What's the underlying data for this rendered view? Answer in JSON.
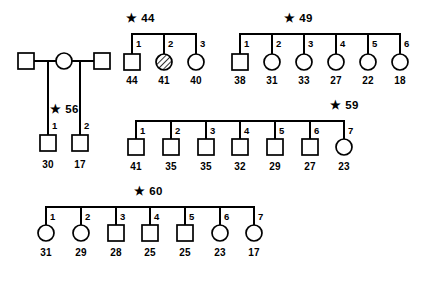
{
  "figure": {
    "background_color": "#ffffff",
    "line_color": "#000000",
    "width": 422,
    "height": 304
  },
  "legend_symbols": {
    "square": "male",
    "circle": "female",
    "hatched_circle": "affected-female"
  },
  "founders": {
    "father_left": {
      "symbol": "square",
      "sex": "male"
    },
    "mother": {
      "symbol": "circle",
      "sex": "female"
    },
    "father_right": {
      "symbol": "square",
      "sex": "male"
    }
  },
  "families": [
    {
      "id": "family-56",
      "label": "★ 56",
      "label_text": "56",
      "children": [
        {
          "index": "1",
          "symbol": "square",
          "sex": "male",
          "age": "30",
          "affected": false
        },
        {
          "index": "2",
          "symbol": "square",
          "sex": "male",
          "age": "17",
          "affected": false
        }
      ]
    },
    {
      "id": "family-44",
      "label": "★ 44",
      "label_text": "44",
      "children": [
        {
          "index": "1",
          "symbol": "square",
          "sex": "male",
          "age": "44",
          "affected": false
        },
        {
          "index": "2",
          "symbol": "circle",
          "sex": "female",
          "age": "41",
          "affected": true
        },
        {
          "index": "3",
          "symbol": "circle",
          "sex": "female",
          "age": "40",
          "affected": false
        }
      ]
    },
    {
      "id": "family-49",
      "label": "★ 49",
      "label_text": "49",
      "children": [
        {
          "index": "1",
          "symbol": "square",
          "sex": "male",
          "age": "38",
          "affected": false
        },
        {
          "index": "2",
          "symbol": "circle",
          "sex": "female",
          "age": "31",
          "affected": false
        },
        {
          "index": "3",
          "symbol": "circle",
          "sex": "female",
          "age": "33",
          "affected": false
        },
        {
          "index": "4",
          "symbol": "circle",
          "sex": "female",
          "age": "27",
          "affected": false
        },
        {
          "index": "5",
          "symbol": "circle",
          "sex": "female",
          "age": "22",
          "affected": false
        },
        {
          "index": "6",
          "symbol": "circle",
          "sex": "female",
          "age": "18",
          "affected": false
        }
      ]
    },
    {
      "id": "family-59",
      "label": "★ 59",
      "label_text": "59",
      "children": [
        {
          "index": "1",
          "symbol": "square",
          "sex": "male",
          "age": "41",
          "affected": false
        },
        {
          "index": "2",
          "symbol": "square",
          "sex": "male",
          "age": "35",
          "affected": false
        },
        {
          "index": "3",
          "symbol": "square",
          "sex": "male",
          "age": "35",
          "affected": false
        },
        {
          "index": "4",
          "symbol": "square",
          "sex": "male",
          "age": "32",
          "affected": false
        },
        {
          "index": "5",
          "symbol": "square",
          "sex": "male",
          "age": "29",
          "affected": false
        },
        {
          "index": "6",
          "symbol": "square",
          "sex": "male",
          "age": "27",
          "affected": false
        },
        {
          "index": "7",
          "symbol": "circle",
          "sex": "female",
          "age": "23",
          "affected": false
        }
      ]
    },
    {
      "id": "family-60",
      "label": "★ 60",
      "label_text": "60",
      "children": [
        {
          "index": "1",
          "symbol": "circle",
          "sex": "female",
          "age": "31",
          "affected": false
        },
        {
          "index": "2",
          "symbol": "circle",
          "sex": "female",
          "age": "29",
          "affected": false
        },
        {
          "index": "3",
          "symbol": "square",
          "sex": "male",
          "age": "28",
          "affected": false
        },
        {
          "index": "4",
          "symbol": "square",
          "sex": "male",
          "age": "25",
          "affected": false
        },
        {
          "index": "5",
          "symbol": "square",
          "sex": "male",
          "age": "25",
          "affected": false
        },
        {
          "index": "6",
          "symbol": "circle",
          "sex": "female",
          "age": "23",
          "affected": false
        },
        {
          "index": "7",
          "symbol": "circle",
          "sex": "female",
          "age": "17",
          "affected": false
        }
      ]
    }
  ]
}
